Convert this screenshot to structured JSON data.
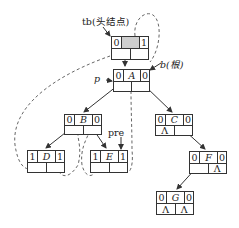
{
  "labels": {
    "head": "tb(头结点)",
    "root": "b(根)",
    "p": "p",
    "pre": "pre"
  },
  "nodes": {
    "head": {
      "ltag": "0",
      "data": "",
      "rtag": "1",
      "lchild": "",
      "rchild": ""
    },
    "A": {
      "ltag": "0",
      "data": "A",
      "rtag": "0",
      "lchild": "",
      "rchild": ""
    },
    "B": {
      "ltag": "0",
      "data": "B",
      "rtag": "0",
      "lchild": "",
      "rchild": ""
    },
    "C": {
      "ltag": "0",
      "data": "C",
      "rtag": "0",
      "lchild": "Λ",
      "rchild": ""
    },
    "D": {
      "ltag": "1",
      "data": "D",
      "rtag": "1",
      "lchild": "",
      "rchild": ""
    },
    "E": {
      "ltag": "1",
      "data": "E",
      "rtag": "1",
      "lchild": "",
      "rchild": ""
    },
    "F": {
      "ltag": "0",
      "data": "F",
      "rtag": "0",
      "lchild": "",
      "rchild": "Λ"
    },
    "G": {
      "ltag": "0",
      "data": "G",
      "rtag": "0",
      "lchild": "Λ",
      "rchild": "Λ"
    }
  },
  "colors": {
    "line": "#333333",
    "thread": "#555555",
    "shade": "#cfcfcf"
  }
}
